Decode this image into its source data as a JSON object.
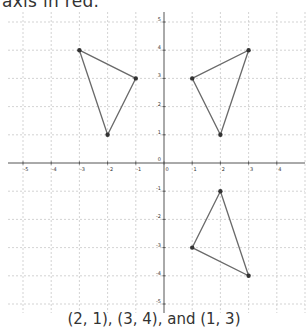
{
  "header": {
    "text": "axis in red."
  },
  "caption": {
    "text": "(2, 1), (3, 4), and (1, 3)"
  },
  "graph": {
    "origin_px": [
      164,
      163
    ],
    "unit_px": 28.2,
    "x_ticks": [
      "-5",
      "-4",
      "-3",
      "-2",
      "-1",
      "0",
      "1",
      "2",
      "3",
      "4"
    ],
    "y_ticks": [
      "5",
      "4",
      "3",
      "2",
      "1",
      "0",
      "-1",
      "-2",
      "-3",
      "-4",
      "-5"
    ],
    "colors": {
      "axis": "#555555",
      "grid": "#c8c8c8",
      "shape": "#6a6a6a",
      "point": "#333333"
    }
  },
  "chart_data": {
    "type": "scatter",
    "title": "",
    "xlabel": "",
    "ylabel": "",
    "xlim": [
      -5.5,
      5
    ],
    "ylim": [
      -5.5,
      5.5
    ],
    "grid": true,
    "series": [
      {
        "name": "triangle-upper-left",
        "points": [
          [
            -3,
            4
          ],
          [
            -1,
            3
          ],
          [
            -2,
            1
          ]
        ],
        "closed": true
      },
      {
        "name": "triangle-upper-right",
        "points": [
          [
            1,
            3
          ],
          [
            3,
            4
          ],
          [
            2,
            1
          ]
        ],
        "closed": true
      },
      {
        "name": "triangle-lower-right",
        "points": [
          [
            2,
            -1
          ],
          [
            1,
            -3
          ],
          [
            3,
            -4
          ]
        ],
        "closed": true
      }
    ],
    "annotations": [
      "(2, 1), (3, 4), and (1, 3)"
    ]
  }
}
